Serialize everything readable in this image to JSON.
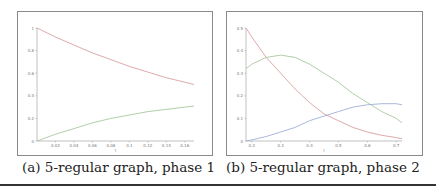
{
  "figure": {
    "captions": {
      "a": "(a) 5-regular graph, phase 1",
      "b": "(b) 5-regular graph, phase 2"
    }
  },
  "chart_data": [
    {
      "type": "line",
      "title": "(a) 5-regular graph, phase 1",
      "xlabel": "t",
      "ylabel": "",
      "xlim": [
        0,
        0.17
      ],
      "ylim": [
        0,
        1
      ],
      "x_ticks": [
        "0.02",
        "0.04",
        "0.06",
        "0.08",
        "0.1",
        "0.12",
        "0.14",
        "0.16"
      ],
      "y_ticks": [
        "0",
        "0.2",
        "0.4",
        "0.6",
        "0.8",
        "1"
      ],
      "grid": false,
      "series": [
        {
          "name": "decreasing",
          "x": [
            0,
            0.02,
            0.04,
            0.06,
            0.08,
            0.1,
            0.12,
            0.14,
            0.16,
            0.17
          ],
          "values": [
            1.0,
            0.92,
            0.85,
            0.78,
            0.72,
            0.66,
            0.61,
            0.56,
            0.52,
            0.5
          ]
        },
        {
          "name": "increasing",
          "x": [
            0,
            0.02,
            0.04,
            0.06,
            0.08,
            0.1,
            0.12,
            0.14,
            0.16,
            0.17
          ],
          "values": [
            0.0,
            0.06,
            0.11,
            0.16,
            0.2,
            0.23,
            0.26,
            0.28,
            0.3,
            0.31
          ]
        }
      ]
    },
    {
      "type": "line",
      "title": "(b) 5-regular graph, phase 2",
      "xlabel": "t",
      "ylabel": "",
      "xlim": [
        0.18,
        0.72
      ],
      "ylim": [
        0,
        0.5
      ],
      "x_ticks": [
        "0.2",
        "0.3",
        "0.4",
        "0.5",
        "0.6",
        "0.7"
      ],
      "y_ticks": [
        "0",
        "0.1",
        "0.2",
        "0.3",
        "0.4",
        "0.5"
      ],
      "grid": false,
      "series": [
        {
          "name": "decreasing",
          "x": [
            0.18,
            0.2,
            0.25,
            0.3,
            0.35,
            0.4,
            0.45,
            0.5,
            0.55,
            0.6,
            0.65,
            0.7,
            0.72
          ],
          "values": [
            0.5,
            0.46,
            0.37,
            0.3,
            0.23,
            0.17,
            0.12,
            0.09,
            0.06,
            0.04,
            0.025,
            0.015,
            0.01
          ]
        },
        {
          "name": "hump",
          "x": [
            0.18,
            0.2,
            0.25,
            0.3,
            0.35,
            0.4,
            0.45,
            0.5,
            0.55,
            0.6,
            0.65,
            0.7,
            0.72
          ],
          "values": [
            0.32,
            0.34,
            0.37,
            0.38,
            0.37,
            0.34,
            0.3,
            0.26,
            0.21,
            0.17,
            0.13,
            0.1,
            0.08
          ]
        },
        {
          "name": "increasing",
          "x": [
            0.18,
            0.2,
            0.25,
            0.3,
            0.35,
            0.4,
            0.45,
            0.5,
            0.55,
            0.6,
            0.65,
            0.7,
            0.72
          ],
          "values": [
            0.0,
            0.005,
            0.02,
            0.04,
            0.06,
            0.09,
            0.11,
            0.13,
            0.15,
            0.16,
            0.165,
            0.165,
            0.16
          ]
        }
      ]
    }
  ]
}
